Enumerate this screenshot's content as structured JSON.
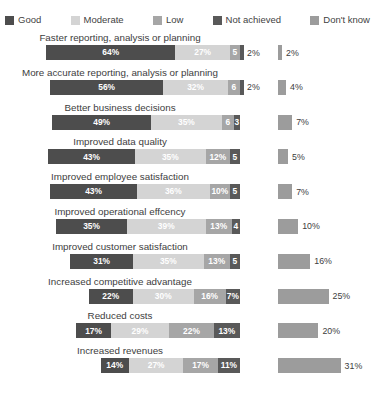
{
  "legend": {
    "items": [
      {
        "label": "Good",
        "color": "#4d4d4d"
      },
      {
        "label": "Moderate",
        "color": "#d4d4d4"
      },
      {
        "label": "Low",
        "color": "#a6a6a6"
      },
      {
        "label": "Not achieved",
        "color": "#595959"
      },
      {
        "label": "Don't know",
        "color": "#9c9c9c"
      }
    ]
  },
  "layout": {
    "stack_right_px": 240,
    "stack_scale_px_per_pct": 2.02,
    "dk_left_px": 278,
    "dk_scale_px_per_pct": 2.02,
    "dk_min_px": 4
  },
  "chart_data": {
    "type": "bar",
    "subtype": "stacked-horizontal-100",
    "title": "",
    "xlabel": "",
    "ylabel": "",
    "grid": false,
    "legend_position": "top",
    "series": [
      {
        "name": "Good",
        "color": "#4d4d4d",
        "values": [
          64,
          56,
          49,
          43,
          43,
          35,
          31,
          22,
          17,
          14
        ]
      },
      {
        "name": "Moderate",
        "color": "#d4d4d4",
        "values": [
          27,
          32,
          35,
          35,
          36,
          39,
          35,
          30,
          29,
          27
        ]
      },
      {
        "name": "Low",
        "color": "#a6a6a6",
        "values": [
          5,
          6,
          6,
          12,
          10,
          13,
          13,
          16,
          22,
          17
        ]
      },
      {
        "name": "Not achieved",
        "color": "#595959",
        "values": [
          2,
          2,
          3,
          5,
          5,
          4,
          5,
          7,
          13,
          11
        ]
      },
      {
        "name": "Don't know",
        "color": "#9c9c9c",
        "values": [
          2,
          4,
          7,
          5,
          7,
          10,
          16,
          25,
          20,
          31
        ]
      }
    ],
    "categories": [
      "Faster reporting, analysis or planning",
      "More accurate reporting, analysis or planning",
      "Better business decisions",
      "Improved data quality",
      "Improved employee satisfaction",
      "Improved operational effcency",
      "Improved customer satisfaction",
      "Increased competitive advantage",
      "Reduced costs",
      "Increased revenues"
    ]
  },
  "rows": [
    {
      "title": "Faster reporting, analysis or planning",
      "segments": [
        {
          "key": "good",
          "value": 64,
          "label": "64%",
          "inside": true
        },
        {
          "key": "mod",
          "value": 27,
          "label": "27%",
          "inside": true
        },
        {
          "key": "low",
          "value": 5,
          "label": "5",
          "inside": true
        },
        {
          "key": "na",
          "value": 2,
          "label": "2%",
          "inside": false
        }
      ],
      "dont_know": {
        "value": 2,
        "label": "2%"
      }
    },
    {
      "title": "More accurate reporting, analysis or planning",
      "segments": [
        {
          "key": "good",
          "value": 56,
          "label": "56%",
          "inside": true
        },
        {
          "key": "mod",
          "value": 32,
          "label": "32%",
          "inside": true
        },
        {
          "key": "low",
          "value": 6,
          "label": "6",
          "inside": true
        },
        {
          "key": "na",
          "value": 2,
          "label": "2%",
          "inside": false
        }
      ],
      "dont_know": {
        "value": 4,
        "label": "4%"
      }
    },
    {
      "title": "Better business decisions",
      "segments": [
        {
          "key": "good",
          "value": 49,
          "label": "49%",
          "inside": true
        },
        {
          "key": "mod",
          "value": 35,
          "label": "35%",
          "inside": true
        },
        {
          "key": "low",
          "value": 6,
          "label": "6",
          "inside": true
        },
        {
          "key": "na",
          "value": 3,
          "label": "3",
          "inside": true
        }
      ],
      "dont_know": {
        "value": 7,
        "label": "7%"
      }
    },
    {
      "title": "Improved data quality",
      "segments": [
        {
          "key": "good",
          "value": 43,
          "label": "43%",
          "inside": true
        },
        {
          "key": "mod",
          "value": 35,
          "label": "35%",
          "inside": true
        },
        {
          "key": "low",
          "value": 12,
          "label": "12%",
          "inside": true
        },
        {
          "key": "na",
          "value": 5,
          "label": "5",
          "inside": true
        }
      ],
      "dont_know": {
        "value": 5,
        "label": "5%"
      }
    },
    {
      "title": "Improved employee satisfaction",
      "segments": [
        {
          "key": "good",
          "value": 43,
          "label": "43%",
          "inside": true
        },
        {
          "key": "mod",
          "value": 36,
          "label": "36%",
          "inside": true
        },
        {
          "key": "low",
          "value": 10,
          "label": "10%",
          "inside": true
        },
        {
          "key": "na",
          "value": 5,
          "label": "5",
          "inside": true
        }
      ],
      "dont_know": {
        "value": 7,
        "label": "7%"
      }
    },
    {
      "title": "Improved operational effcency",
      "segments": [
        {
          "key": "good",
          "value": 35,
          "label": "35%",
          "inside": true
        },
        {
          "key": "mod",
          "value": 39,
          "label": "39%",
          "inside": true
        },
        {
          "key": "low",
          "value": 13,
          "label": "13%",
          "inside": true
        },
        {
          "key": "na",
          "value": 4,
          "label": "4",
          "inside": true
        }
      ],
      "dont_know": {
        "value": 10,
        "label": "10%"
      }
    },
    {
      "title": "Improved customer satisfaction",
      "segments": [
        {
          "key": "good",
          "value": 31,
          "label": "31%",
          "inside": true
        },
        {
          "key": "mod",
          "value": 35,
          "label": "35%",
          "inside": true
        },
        {
          "key": "low",
          "value": 13,
          "label": "13%",
          "inside": true
        },
        {
          "key": "na",
          "value": 5,
          "label": "5",
          "inside": true
        }
      ],
      "dont_know": {
        "value": 16,
        "label": "16%"
      }
    },
    {
      "title": "Increased competitive advantage",
      "segments": [
        {
          "key": "good",
          "value": 22,
          "label": "22%",
          "inside": true
        },
        {
          "key": "mod",
          "value": 30,
          "label": "30%",
          "inside": true
        },
        {
          "key": "low",
          "value": 16,
          "label": "16%",
          "inside": true
        },
        {
          "key": "na",
          "value": 7,
          "label": "7%",
          "inside": true
        }
      ],
      "dont_know": {
        "value": 25,
        "label": "25%"
      }
    },
    {
      "title": "Reduced costs",
      "segments": [
        {
          "key": "good",
          "value": 17,
          "label": "17%",
          "inside": true
        },
        {
          "key": "mod",
          "value": 29,
          "label": "29%",
          "inside": true
        },
        {
          "key": "low",
          "value": 22,
          "label": "22%",
          "inside": true
        },
        {
          "key": "na",
          "value": 13,
          "label": "13%",
          "inside": true
        }
      ],
      "dont_know": {
        "value": 20,
        "label": "20%"
      }
    },
    {
      "title": "Increased revenues",
      "segments": [
        {
          "key": "good",
          "value": 14,
          "label": "14%",
          "inside": true
        },
        {
          "key": "mod",
          "value": 27,
          "label": "27%",
          "inside": true
        },
        {
          "key": "low",
          "value": 17,
          "label": "17%",
          "inside": true
        },
        {
          "key": "na",
          "value": 11,
          "label": "11%",
          "inside": true
        }
      ],
      "dont_know": {
        "value": 31,
        "label": "31%"
      }
    }
  ]
}
